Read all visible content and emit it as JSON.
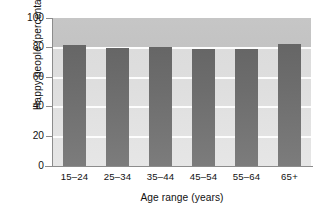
{
  "chart_data": {
    "type": "bar",
    "title": "",
    "subtitle": "",
    "categories": [
      "15–24",
      "25–34",
      "35–44",
      "45–54",
      "55–64",
      "65+"
    ],
    "values": [
      81.5,
      80,
      80.5,
      79,
      79,
      82.5
    ],
    "series": [
      {
        "name": "Happy people",
        "values": [
          81.5,
          80,
          80.5,
          79,
          79,
          82.5
        ]
      }
    ],
    "xlabel": "Age range (years)",
    "ylabel": "Happy people (percentage)",
    "ylim": [
      0,
      100
    ],
    "yticks": [
      0,
      20,
      40,
      60,
      80,
      100
    ],
    "ytick_labels": [
      "0",
      "20",
      "40",
      "60",
      "80",
      "100"
    ],
    "grid": "horizontal-white-gridlines",
    "legend": "none",
    "bar_color": "#6d6d6d",
    "plot_background": "#dedede",
    "plot_background_top": "#c4c4c4",
    "gridline_color": "#fdfdfd",
    "axis_color": "#8c8c8c",
    "figure_background": "#ffffff"
  }
}
